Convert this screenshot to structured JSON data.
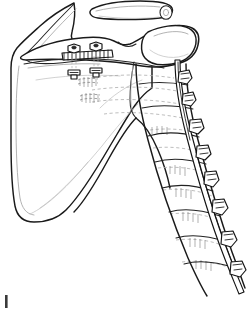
{
  "figure": {
    "title": "Scapula, clavicle, rib cage and spinal column with posterior fixation construct",
    "type": "patent-line-drawing",
    "background_color": "#ffffff",
    "line_color": "#1a1a1a",
    "faint_line_color": "#b0b0b0",
    "hardware_color": "#2b2b2b",
    "width_px": 247,
    "height_px": 313,
    "corner_mark_label": "|"
  },
  "anatomy": {
    "clavicle": {
      "name": "clavicle",
      "label": "clavicle",
      "description": "cylindrical bone at top right with cut cross-sectioned end"
    },
    "scapula_body": {
      "name": "scapula-body",
      "label": "scapula",
      "description": "large triangular blade occupying the left portion"
    },
    "scapula_spine": {
      "name": "scapula-spine",
      "label": "spine of scapula",
      "description": "ridge running horizontally across the upper scapula"
    },
    "acromion": {
      "name": "acromion",
      "label": "acromion",
      "description": "rounded lateral process extending to the right"
    },
    "lateral_border": {
      "name": "lateral-border",
      "label": "lateral border",
      "description": "diagonal inferior-lateral edge of the scapula"
    },
    "ribs": {
      "name": "rib-set",
      "label": "ribs",
      "count": 9,
      "description": "dashed curved lines representing ribs behind and below the scapula"
    },
    "vertebral_column": {
      "name": "vertebral-column",
      "label": "vertebral column",
      "count": 8,
      "description": "stacked vertebral bodies descending diagonally on the right"
    }
  },
  "hardware": {
    "scapular_plate": {
      "name": "scapular-plate",
      "label": "bone plate",
      "screw_count": 2,
      "description": "serrated plate fixed across the scapular spine"
    },
    "plate_screws": {
      "name": "plate-screws",
      "label": "plate screws",
      "count": 2,
      "description": "two screws with hexagonal heads passing through the plate with nuts beneath"
    },
    "spinal_rod": {
      "name": "spinal-rod",
      "label": "fixation rod",
      "description": "long rod running along the lateral aspect of the vertebral column"
    },
    "pedicle_screws": {
      "name": "pedicle-screws",
      "label": "pedicle screws",
      "count": 8,
      "description": "screw heads clamped onto the rod along its length"
    }
  }
}
